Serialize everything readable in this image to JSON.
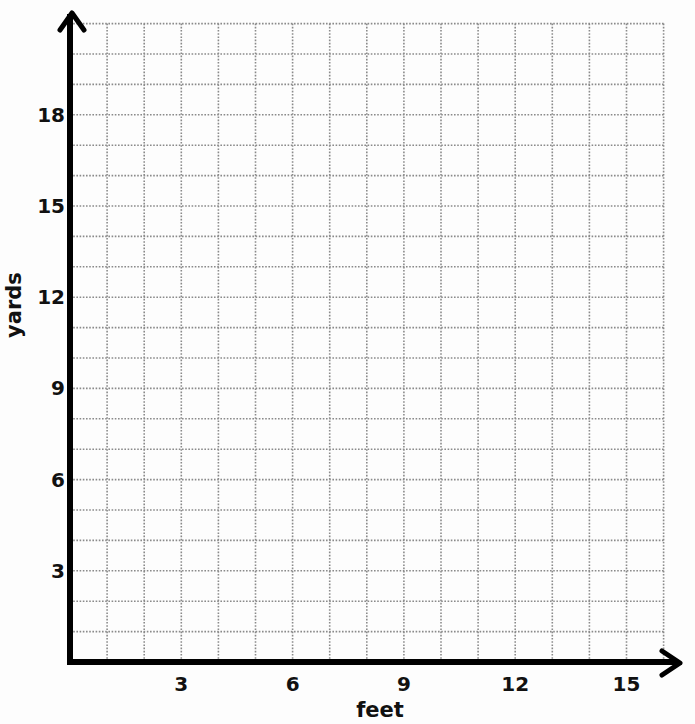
{
  "chart_data": {
    "type": "scatter",
    "title": "",
    "xlabel": "feet",
    "ylabel": "yards",
    "xlim": [
      0,
      16
    ],
    "ylim": [
      0,
      21
    ],
    "x_ticks": [
      3,
      6,
      9,
      12,
      15
    ],
    "y_ticks": [
      3,
      6,
      9,
      12,
      15,
      18
    ],
    "x_tick_labels": [
      "3",
      "6",
      "9",
      "12",
      "15"
    ],
    "y_tick_labels": [
      "3",
      "6",
      "9",
      "12",
      "15",
      "18"
    ],
    "grid": true,
    "grid_style": "dotted",
    "grid_step_x": 1,
    "grid_step_y": 1,
    "series": [],
    "legend": null,
    "note": "Blank coordinate grid; no data points plotted"
  },
  "colors": {
    "axis": "#000000",
    "grid": "#8a8a8a",
    "background": "#fdfdfd"
  }
}
